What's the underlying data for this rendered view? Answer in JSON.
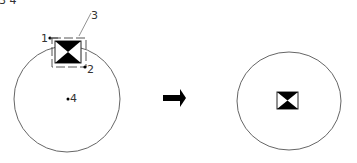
{
  "header_fragment": "3 4",
  "left_diagram": {
    "labels": {
      "p1": "1",
      "p2": "2",
      "p3": "3",
      "p4": "4"
    }
  },
  "arrow": {
    "direction": "right"
  },
  "right_diagram": {},
  "colors": {
    "line": "#555555",
    "fill": "#000000",
    "background": "#ffffff"
  }
}
